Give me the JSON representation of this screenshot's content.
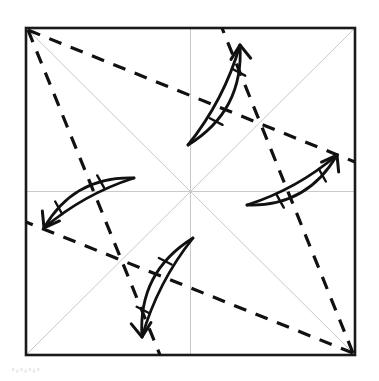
{
  "figure": {
    "kind": "origami-fold-diagram",
    "title": "",
    "caption": "",
    "background_color": "#ffffff",
    "width": 379,
    "height": 381
  },
  "sheet": {
    "name": "square-paper-outline",
    "left": 26,
    "top": 28,
    "right": 355,
    "bottom": 355,
    "stroke_color": "#1a1a1a",
    "stroke_width": 2.6,
    "fill_color": "#ffffff"
  },
  "center": {
    "x": 190.5,
    "y": 191.5
  },
  "reference_lines": {
    "name": "existing-crease-lines",
    "stroke_color": "#c9c9c9",
    "stroke_width": 1,
    "style": "solid-thin",
    "segments": [
      {
        "name": "horizontal-crease",
        "x1": 26,
        "y1": 191.5,
        "x2": 355,
        "y2": 191.5
      },
      {
        "name": "vertical-crease",
        "x1": 190.5,
        "y1": 28,
        "x2": 190.5,
        "y2": 355
      },
      {
        "name": "diagonal-crease-tl-br",
        "x1": 26,
        "y1": 28,
        "x2": 355,
        "y2": 355
      },
      {
        "name": "diagonal-crease-bl-tr",
        "x1": 26,
        "y1": 355,
        "x2": 355,
        "y2": 28
      }
    ]
  },
  "fold_lines": {
    "name": "valley-fold-dashed-lines",
    "stroke_color": "#111111",
    "stroke_width": 3.2,
    "style": "dashed",
    "dash_pattern": "13 10",
    "segments": [
      {
        "name": "dashed-fold-tl-to-right-edge",
        "x1": 28,
        "y1": 30,
        "x2": 355,
        "y2": 162
      },
      {
        "name": "dashed-fold-tl-to-bottom-edge",
        "x1": 28,
        "y1": 30,
        "x2": 160,
        "y2": 355
      },
      {
        "name": "dashed-fold-br-to-left-edge",
        "x1": 353,
        "y1": 353,
        "x2": 26,
        "y2": 222
      },
      {
        "name": "dashed-fold-br-to-top-edge",
        "x1": 353,
        "y1": 353,
        "x2": 222,
        "y2": 28
      }
    ]
  },
  "fold_arrows": {
    "name": "rotational-fold-arrows",
    "count": 4,
    "stroke_color": "#111111",
    "stroke_width": 2.8,
    "arrowhead_style": "open-v",
    "symmetry": "4-fold rotational about center",
    "items": [
      {
        "name": "fold-arrow-top",
        "direction": "up-right",
        "tail_x": 188,
        "tail_y": 145,
        "head_x": 240,
        "head_y": 45,
        "tick_label": ""
      },
      {
        "name": "fold-arrow-right",
        "direction": "up-right",
        "tail_x": 247,
        "tail_y": 205,
        "head_x": 337,
        "head_y": 155,
        "tick_label": ""
      },
      {
        "name": "fold-arrow-bottom",
        "direction": "down-left",
        "tail_x": 193,
        "tail_y": 238,
        "head_x": 142,
        "head_y": 337,
        "tick_label": ""
      },
      {
        "name": "fold-arrow-left",
        "direction": "down-left",
        "tail_x": 134,
        "tail_y": 178,
        "head_x": 44,
        "head_y": 228,
        "tick_label": ""
      }
    ]
  },
  "artifact": {
    "name": "scanner-speckle-artifact",
    "x": 12,
    "y": 368,
    "color": "#e8e8e8"
  }
}
